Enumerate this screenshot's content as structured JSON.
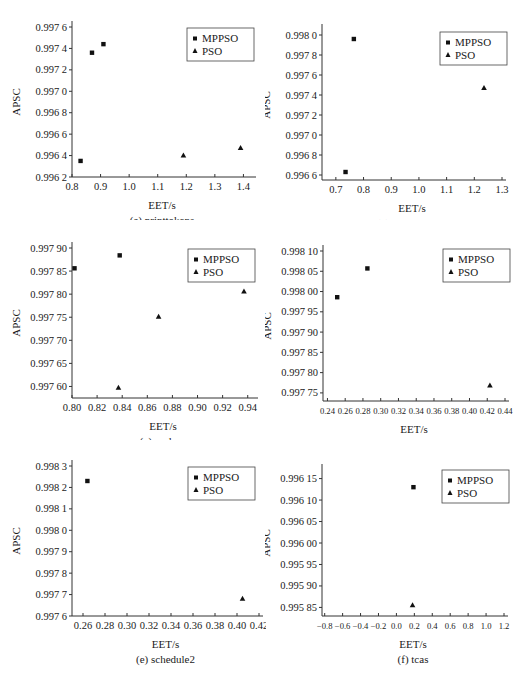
{
  "legend": {
    "series1": "MPPSO",
    "series2": "PSO"
  },
  "chart_data": [
    {
      "id": "a",
      "type": "scatter",
      "caption": "(a) printtokens",
      "xlabel": "EET/s",
      "ylabel": "APSC",
      "xlim": [
        0.8,
        1.43
      ],
      "ylim": [
        0.9962,
        0.9976
      ],
      "xticks": [
        0.8,
        0.9,
        1.0,
        1.1,
        1.2,
        1.3,
        1.4
      ],
      "xtick_labels": [
        "0.8",
        "0.9",
        "1.0",
        "1.1",
        "1.2",
        "1.3",
        "1.4"
      ],
      "yticks": [
        0.9962,
        0.9964,
        0.9966,
        0.9968,
        0.997,
        0.9972,
        0.9974,
        0.9976
      ],
      "ytick_labels": [
        "0.996 2",
        "0.996 4",
        "0.996 6",
        "0.996 8",
        "0.997 0",
        "0.997 2",
        "0.997 4",
        "0.997 6"
      ],
      "series": [
        {
          "name": "MPPSO",
          "marker": "square",
          "points": [
            [
              0.83,
              0.99635
            ],
            [
              0.87,
              0.99736
            ],
            [
              0.91,
              0.99744
            ]
          ]
        },
        {
          "name": "PSO",
          "marker": "triangle",
          "points": [
            [
              1.19,
              0.9964
            ],
            [
              1.39,
              0.99647
            ]
          ]
        }
      ]
    },
    {
      "id": "b",
      "type": "scatter",
      "caption": "(b) printtokens2",
      "xlabel": "EET/s",
      "ylabel": "APSC",
      "xlim": [
        0.65,
        1.3
      ],
      "ylim": [
        0.99655,
        0.99805
      ],
      "xticks": [
        0.7,
        0.8,
        0.9,
        1.0,
        1.1,
        1.2,
        1.3
      ],
      "xtick_labels": [
        "0.7",
        "0.8",
        "0.9",
        "1.0",
        "1.1",
        "1.2",
        "1.3"
      ],
      "yticks": [
        0.9966,
        0.9968,
        0.997,
        0.9972,
        0.9974,
        0.9976,
        0.9978,
        0.998
      ],
      "ytick_labels": [
        "0.996 6",
        "0.996 8",
        "0.997 0",
        "0.997 2",
        "0.997 4",
        "0.997 6",
        "0.997 8",
        "0.998 0"
      ],
      "series": [
        {
          "name": "MPPSO",
          "marker": "square",
          "points": [
            [
              0.735,
              0.99663
            ],
            [
              0.765,
              0.99796
            ]
          ]
        },
        {
          "name": "PSO",
          "marker": "triangle",
          "points": [
            [
              1.235,
              0.99747
            ]
          ]
        }
      ]
    },
    {
      "id": "c",
      "type": "scatter",
      "caption": "(c) replace",
      "xlabel": "EET/s",
      "ylabel": "APSC",
      "xlim": [
        0.8,
        0.945
      ],
      "ylim": [
        0.997575,
        0.9979
      ],
      "xticks": [
        0.8,
        0.82,
        0.84,
        0.86,
        0.88,
        0.9,
        0.92,
        0.94
      ],
      "xtick_labels": [
        "0.80",
        "0.82",
        "0.84",
        "0.86",
        "0.88",
        "0.90",
        "0.92",
        "0.94"
      ],
      "yticks": [
        0.9976,
        0.99765,
        0.9977,
        0.99775,
        0.9978,
        0.99785,
        0.9979
      ],
      "ytick_labels": [
        "0.997 60",
        "0.997 65",
        "0.997 70",
        "0.997 75",
        "0.997 80",
        "0.997 85",
        "0.997 90"
      ],
      "series": [
        {
          "name": "MPPSO",
          "marker": "square",
          "points": [
            [
              0.802,
              0.997856
            ],
            [
              0.838,
              0.997884
            ]
          ]
        },
        {
          "name": "PSO",
          "marker": "triangle",
          "points": [
            [
              0.837,
              0.997597
            ],
            [
              0.869,
              0.997751
            ],
            [
              0.937,
              0.997806
            ]
          ]
        }
      ]
    },
    {
      "id": "d",
      "type": "scatter",
      "caption": "(d) schedule",
      "xlabel": "EET/s",
      "ylabel": "APSC",
      "xlim": [
        0.235,
        0.44
      ],
      "ylim": [
        0.99773,
        0.9981
      ],
      "xticks": [
        0.24,
        0.26,
        0.28,
        0.3,
        0.32,
        0.34,
        0.36,
        0.38,
        0.4,
        0.42,
        0.44
      ],
      "xtick_labels": [
        "0.24",
        "0.26",
        "0.28",
        "0.30",
        "0.32",
        "0.34",
        "0.36",
        "0.38",
        "0.40",
        "0.42",
        "0.44"
      ],
      "yticks": [
        0.99775,
        0.9978,
        0.99785,
        0.9979,
        0.99795,
        0.998,
        0.99805,
        0.9981
      ],
      "ytick_labels": [
        "0.997 75",
        "0.997 80",
        "0.997 85",
        "0.997 90",
        "0.997 95",
        "0.998 00",
        "0.998 05",
        "0.998 10"
      ],
      "series": [
        {
          "name": "MPPSO",
          "marker": "square",
          "points": [
            [
              0.251,
              0.997986
            ],
            [
              0.285,
              0.998057
            ]
          ]
        },
        {
          "name": "PSO",
          "marker": "triangle",
          "points": [
            [
              0.423,
              0.997768
            ]
          ]
        }
      ]
    },
    {
      "id": "e",
      "type": "scatter",
      "caption": "(e) schedule2",
      "xlabel": "EET/s",
      "ylabel": "APSC",
      "xlim": [
        0.25,
        0.42
      ],
      "ylim": [
        0.9976,
        0.9983
      ],
      "xticks": [
        0.26,
        0.28,
        0.3,
        0.32,
        0.34,
        0.36,
        0.38,
        0.4,
        0.42
      ],
      "xtick_labels": [
        "0.26",
        "0.28",
        "0.30",
        "0.32",
        "0.34",
        "0.36",
        "0.38",
        "0.40",
        "0.42"
      ],
      "yticks": [
        0.9976,
        0.9977,
        0.9978,
        0.9979,
        0.998,
        0.9981,
        0.9982,
        0.9983
      ],
      "ytick_labels": [
        "0.997 6",
        "0.997 7",
        "0.997 8",
        "0.997 9",
        "0.998 0",
        "0.998 1",
        "0.998 2",
        "0.998 3"
      ],
      "series": [
        {
          "name": "MPPSO",
          "marker": "square",
          "points": [
            [
              0.264,
              0.99823
            ]
          ]
        },
        {
          "name": "PSO",
          "marker": "triangle",
          "points": [
            [
              0.405,
              0.99768
            ]
          ]
        }
      ]
    },
    {
      "id": "f",
      "type": "scatter",
      "caption": "(f) tcas",
      "xlabel": "EET/s",
      "ylabel": "APSC",
      "xlim": [
        -0.83,
        1.2
      ],
      "ylim": [
        0.99583,
        0.99617
      ],
      "xticks": [
        -0.8,
        -0.6,
        -0.4,
        -0.2,
        0.0,
        0.2,
        0.4,
        0.6,
        0.8,
        1.0,
        1.2
      ],
      "xtick_labels": [
        "−0.8",
        "−0.6",
        "−0.4",
        "−0.2",
        "0.0",
        "0.2",
        "0.4",
        "0.6",
        "0.8",
        "1.0",
        "1.2"
      ],
      "yticks": [
        0.99585,
        0.9959,
        0.99595,
        0.996,
        0.99605,
        0.9961,
        0.99615
      ],
      "ytick_labels": [
        "0.995 85",
        "0.995 90",
        "0.995 95",
        "0.996 00",
        "0.996 05",
        "0.996 10",
        "0.996 15"
      ],
      "series": [
        {
          "name": "MPPSO",
          "marker": "square",
          "points": [
            [
              0.19,
              0.99613
            ]
          ]
        },
        {
          "name": "PSO",
          "marker": "triangle",
          "points": [
            [
              0.18,
              0.995855
            ]
          ]
        }
      ]
    }
  ],
  "layout": [
    {
      "left": 0,
      "top": 0,
      "plot": [
        72,
        27,
        180,
        150
      ],
      "legend": [
        187,
        28
      ]
    },
    {
      "left": 265,
      "top": 0,
      "plot": [
        57,
        30,
        180,
        150
      ],
      "legend": [
        175,
        32
      ]
    },
    {
      "left": 0,
      "top": 220,
      "plot": [
        72,
        28,
        182,
        150
      ],
      "legend": [
        188,
        29
      ]
    },
    {
      "left": 265,
      "top": 220,
      "plot": [
        58,
        31,
        182,
        150
      ],
      "legend": [
        178,
        29
      ]
    },
    {
      "left": 0,
      "top": 440,
      "plot": [
        72,
        26,
        187,
        150
      ],
      "legend": [
        188,
        27
      ]
    },
    {
      "left": 265,
      "top": 440,
      "plot": [
        57,
        30,
        182,
        146
      ],
      "legend": [
        177,
        30
      ]
    }
  ]
}
